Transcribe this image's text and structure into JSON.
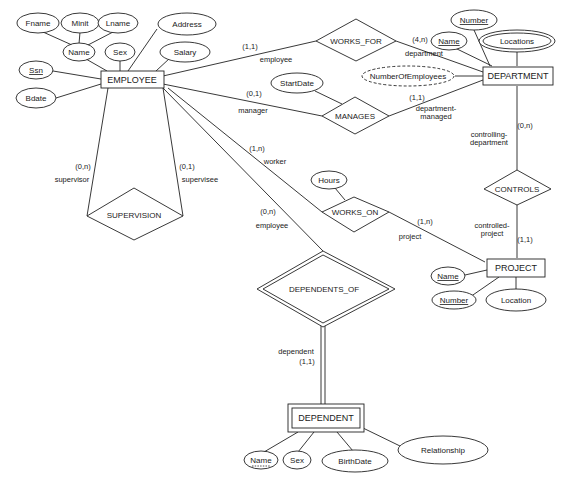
{
  "diagram": {
    "type": "ER diagram (min,max) notation",
    "entities": [
      {
        "id": "employee",
        "label": "EMPLOYEE",
        "weak": false
      },
      {
        "id": "department",
        "label": "DEPARTMENT",
        "weak": false
      },
      {
        "id": "project",
        "label": "PROJECT",
        "weak": false
      },
      {
        "id": "dependent",
        "label": "DEPENDENT",
        "weak": true
      }
    ],
    "relationships": [
      {
        "id": "works_for",
        "label": "WORKS_FOR",
        "identifying": false
      },
      {
        "id": "manages",
        "label": "MANAGES",
        "identifying": false
      },
      {
        "id": "works_on",
        "label": "WORKS_ON",
        "identifying": false
      },
      {
        "id": "controls",
        "label": "CONTROLS",
        "identifying": false
      },
      {
        "id": "supervision",
        "label": "SUPERVISION",
        "identifying": false
      },
      {
        "id": "dependents_of",
        "label": "DEPENDENTS_OF",
        "identifying": true
      }
    ],
    "attributes": {
      "fname": "Fname",
      "minit": "Minit",
      "lname": "Lname",
      "emp_name": "Name",
      "sex": "Sex",
      "address": "Address",
      "salary": "Salary",
      "ssn": "Ssn",
      "bdate": "Bdate",
      "dept_number": "Number",
      "dept_name": "Name",
      "locations": "Locations",
      "num_employees": "NumberOfEmployees",
      "start_date": "StartDate",
      "hours": "Hours",
      "proj_name": "Name",
      "proj_number": "Number",
      "proj_location": "Location",
      "dep_name": "Name",
      "dep_sex": "Sex",
      "birth_date": "BirthDate",
      "relationship": "Relationship"
    },
    "constraints": {
      "works_for_employee": "(1,1)",
      "works_for_employee_role": "employee",
      "works_for_department": "(4,n)",
      "works_for_department_role": "department",
      "manages_employee": "(0,1)",
      "manages_employee_role": "manager",
      "manages_department": "(1,1)",
      "manages_department_role_1": "department-",
      "manages_department_role_2": "managed",
      "works_on_employee": "(1,n)",
      "works_on_employee_role": "worker",
      "works_on_project": "(1,n)",
      "works_on_project_role": "project",
      "controls_department": "(0,n)",
      "controls_department_role_1": "controlling-",
      "controls_department_role_2": "department",
      "controls_project": "(1,1)",
      "controls_project_role_1": "controlled-",
      "controls_project_role_2": "project",
      "supervision_supervisor": "(0,n)",
      "supervision_supervisor_role": "supervisor",
      "supervision_supervisee": "(0,1)",
      "supervision_supervisee_role": "supervisee",
      "dependents_of_employee": "(0,n)",
      "dependents_of_employee_role": "employee",
      "dependents_of_dependent_role": "dependent",
      "dependents_of_dependent": "(1,1)"
    }
  }
}
